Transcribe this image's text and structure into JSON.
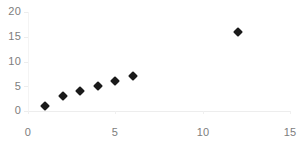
{
  "chart_data": {
    "type": "scatter",
    "title": "",
    "subtitle": "",
    "xlabel": "",
    "ylabel": "",
    "xlim": [
      0,
      15
    ],
    "ylim": [
      0,
      20
    ],
    "xticks": [
      0,
      5,
      10,
      15
    ],
    "yticks": [
      0,
      5,
      10,
      15,
      20
    ],
    "xtick_labels": [
      "0",
      "5",
      "10",
      "15"
    ],
    "ytick_labels": [
      "0",
      "5",
      "10",
      "15",
      "20"
    ],
    "grid": false,
    "legend": false,
    "legend_position": "none",
    "marker_style": "diamond",
    "marker_color": "#1a1a1a",
    "axis_color": "#ededed",
    "tick_label_color": "#7d7d7d",
    "background_color": "#ffffff",
    "x": [
      1,
      2,
      3,
      4,
      5,
      6,
      12
    ],
    "y": [
      1,
      3,
      4,
      5,
      6,
      7,
      16
    ],
    "points": [
      {
        "x": 1,
        "y": 1
      },
      {
        "x": 2,
        "y": 3
      },
      {
        "x": 3,
        "y": 4
      },
      {
        "x": 4,
        "y": 5
      },
      {
        "x": 5,
        "y": 6
      },
      {
        "x": 6,
        "y": 7
      },
      {
        "x": 12,
        "y": 16
      }
    ],
    "series": [
      {
        "name": "",
        "x": [
          1,
          2,
          3,
          4,
          5,
          6,
          12
        ],
        "values": [
          1,
          3,
          4,
          5,
          6,
          7,
          16
        ]
      }
    ]
  }
}
